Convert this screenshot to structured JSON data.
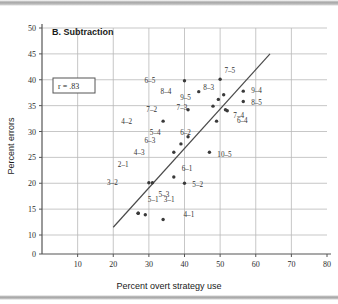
{
  "figure": {
    "panel_label": "B. Subtraction",
    "correlation_label": "r = .83",
    "xlabel": "Percent overt strategy use",
    "ylabel": "Percent errors",
    "line_color": "#4a4a4a",
    "grid_color": "#b9b9b9",
    "point_color": "#3a3a3a"
  },
  "chart_data": {
    "type": "scatter",
    "title": "B. Subtraction",
    "xlabel": "Percent overt strategy use",
    "ylabel": "Percent errors",
    "xlim": [
      0,
      80
    ],
    "ylim": [
      0,
      50
    ],
    "xticks": [
      10,
      20,
      30,
      40,
      50,
      60,
      70,
      80
    ],
    "yticks": [
      0,
      10,
      15,
      20,
      25,
      30,
      35,
      40,
      45,
      50
    ],
    "grid": true,
    "legend": "none",
    "annotations": [
      {
        "text": "r = .83",
        "x": 9,
        "y": 38,
        "boxed": true
      },
      {
        "text": "B. Subtraction",
        "x": 12,
        "y": 47.2,
        "boxed": false
      }
    ],
    "trendline": {
      "x0": 20.0,
      "y0": 11.5,
      "x1": 64.0,
      "y1": 45.0,
      "label": "regression line"
    },
    "points": [
      {
        "label": "2-1",
        "x": 27.0,
        "y": 14.2,
        "lx": -2,
        "ly": 9.5
      },
      {
        "label": "3-1",
        "x": 29.0,
        "y": 13.9,
        "lx": 4.5,
        "ly": 3.0
      },
      {
        "label": "4-1",
        "x": 34.0,
        "y": 13.0,
        "lx": 5.0,
        "ly": 1.0
      },
      {
        "label": "5-1",
        "x": 27.0,
        "y": 14.2,
        "lx": 2.0,
        "ly": 2.6
      },
      {
        "label": "3-2",
        "x": 30.0,
        "y": 20.1,
        "lx": -8.0,
        "ly": 0.0
      },
      {
        "label": "5-3",
        "x": 31.0,
        "y": 20.1,
        "lx": 1.0,
        "ly": -2.2
      },
      {
        "label": "5-2",
        "x": 40.0,
        "y": 20.0,
        "lx": 1.5,
        "ly": -0.2
      },
      {
        "label": "6-1",
        "x": 37.0,
        "y": 21.2,
        "lx": 1.5,
        "ly": 1.6
      },
      {
        "label": "4-3",
        "x": 37.0,
        "y": 26.0,
        "lx": -7.5,
        "ly": 0.0
      },
      {
        "label": "10-5",
        "x": 47.0,
        "y": 26.0,
        "lx": 1.5,
        "ly": -0.4
      },
      {
        "label": "6-3",
        "x": 39.0,
        "y": 27.6,
        "lx": -6.5,
        "ly": 0.6
      },
      {
        "label": "5-4",
        "x": 41.0,
        "y": 29.0,
        "lx": -7.0,
        "ly": 0.8
      },
      {
        "label": "6-2",
        "x": 49.0,
        "y": 32.0,
        "lx": -6.5,
        "ly": -2.2
      },
      {
        "label": "4-2",
        "x": 34.0,
        "y": 32.0,
        "lx": -8.0,
        "ly": 0.0
      },
      {
        "label": "6-4",
        "x": 52.0,
        "y": 34.0,
        "lx": 2.0,
        "ly": -1.8
      },
      {
        "label": "7-2",
        "x": 41.0,
        "y": 34.2,
        "lx": -8.0,
        "ly": 0.0
      },
      {
        "label": "7-3",
        "x": 48.0,
        "y": 34.9,
        "lx": -6.5,
        "ly": -0.2
      },
      {
        "label": "7-4",
        "x": 51.5,
        "y": 34.2,
        "lx": 1.5,
        "ly": -1.0
      },
      {
        "label": "9-5",
        "x": 49.5,
        "y": 36.2,
        "lx": -7.0,
        "ly": 0.4
      },
      {
        "label": "8-5",
        "x": 56.5,
        "y": 35.8,
        "lx": 1.5,
        "ly": -0.2
      },
      {
        "label": "8-4",
        "x": 44.0,
        "y": 37.7,
        "lx": -7.0,
        "ly": 0.0
      },
      {
        "label": "8-3",
        "x": 51.0,
        "y": 37.1,
        "lx": -2.0,
        "ly": 1.4
      },
      {
        "label": "9-4",
        "x": 56.5,
        "y": 37.8,
        "lx": 1.5,
        "ly": 0.2
      },
      {
        "label": "6-5",
        "x": 40.0,
        "y": 39.8,
        "lx": -7.5,
        "ly": 0.0
      },
      {
        "label": "7-5",
        "x": 50.0,
        "y": 40.1,
        "lx": 0.5,
        "ly": 1.8
      }
    ]
  }
}
